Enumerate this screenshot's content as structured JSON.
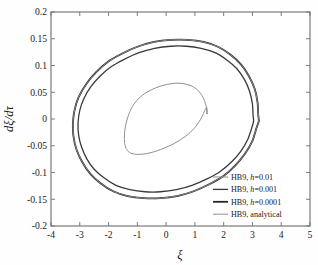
{
  "figure": {
    "background_color": "#fefefe",
    "plot_background_color": "#ffffff",
    "frame_color": "#6e6e6e"
  },
  "axes": {
    "x_label": "ξ",
    "y_label": "dξ/dτ",
    "x_ticks": [
      "-4",
      "-3",
      "-2",
      "-1",
      "0",
      "1",
      "2",
      "3",
      "4",
      "5"
    ],
    "y_ticks": [
      "0.2",
      "0.15",
      "0.1",
      "0.05",
      "0",
      "-0.05",
      "-0.1",
      "-0.15",
      "-0.2"
    ]
  },
  "legend": {
    "position": "lower-right",
    "border": false,
    "items": [
      {
        "label_prefix": "HB9, ",
        "label_italic": "h",
        "label_suffix": "=0.01",
        "full_label": "HB9, h=0.01",
        "color": "#8c8c8c",
        "width": 1.0
      },
      {
        "label_prefix": "HB9, ",
        "label_italic": "h",
        "label_suffix": "=0.001",
        "full_label": "HB9, h=0.001",
        "color": "#3a3a3a",
        "width": 1.3
      },
      {
        "label_prefix": "HB9, ",
        "label_italic": "h",
        "label_suffix": "=0.0001",
        "full_label": "HB9, h=0.0001",
        "color": "#262626",
        "width": 1.8
      },
      {
        "label_prefix": "HB9, ",
        "label_italic": "",
        "label_suffix": "analytical",
        "full_label": "HB9, analytical",
        "color": "#8c8c8c",
        "width": 1.0
      }
    ]
  },
  "chart_data": {
    "type": "line",
    "title": "",
    "xlabel": "ξ",
    "ylabel": "dξ/dτ",
    "xlim": [
      -4,
      5
    ],
    "ylim": [
      -0.2,
      0.2
    ],
    "xticks": [
      -4,
      -3,
      -2,
      -1,
      0,
      1,
      2,
      3,
      4,
      5
    ],
    "yticks": [
      -0.2,
      -0.15,
      -0.1,
      -0.05,
      0,
      0.05,
      0.1,
      0.15,
      0.2
    ],
    "grid": false,
    "legend_position": "lower right",
    "series": [
      {
        "name": "HB9, h=0.01",
        "color": "#8c8c8c",
        "linewidth": 1.0,
        "description": "small inner limit cycle, amplitude approx 1.45 in xi, 0.065 in dxi/dtau",
        "x": [
          1.42,
          1.4,
          1.33,
          1.22,
          1.08,
          0.88,
          0.62,
          0.34,
          0.06,
          -0.22,
          -0.5,
          -0.76,
          -0.98,
          -1.14,
          -1.26,
          -1.34,
          -1.4,
          -1.44,
          -1.45,
          -1.44,
          -1.4,
          -1.33,
          -1.22,
          -1.06,
          -0.86,
          -0.62,
          -0.34,
          -0.05,
          0.24,
          0.52,
          0.78,
          1.0,
          1.16,
          1.28,
          1.36,
          1.41,
          1.43,
          1.42
        ],
        "y": [
          0.01,
          0.022,
          0.035,
          0.046,
          0.055,
          0.062,
          0.066,
          0.067,
          0.065,
          0.061,
          0.055,
          0.047,
          0.037,
          0.026,
          0.014,
          0.002,
          -0.01,
          -0.024,
          -0.036,
          -0.046,
          -0.054,
          -0.06,
          -0.064,
          -0.066,
          -0.066,
          -0.064,
          -0.06,
          -0.054,
          -0.047,
          -0.038,
          -0.028,
          -0.016,
          -0.004,
          0.008,
          0.018,
          0.022,
          0.016,
          0.01
        ]
      },
      {
        "name": "HB9, h=0.001",
        "color": "#3a3a3a",
        "linewidth": 1.3,
        "description": "large limit cycle slightly inside the h=0.0001 curve, peak dxi/dtau approx 0.136",
        "x": [
          3.02,
          3.0,
          2.9,
          2.72,
          2.46,
          2.12,
          1.7,
          1.22,
          0.7,
          0.16,
          -0.4,
          -0.94,
          -1.44,
          -1.9,
          -2.3,
          -2.62,
          -2.86,
          -3.0,
          -3.06,
          -3.04,
          -2.94,
          -2.76,
          -2.5,
          -2.16,
          -1.74,
          -1.26,
          -0.74,
          -0.2,
          0.36,
          0.9,
          1.42,
          1.88,
          2.28,
          2.6,
          2.84,
          2.98,
          3.04,
          3.02
        ],
        "y": [
          0.008,
          0.028,
          0.052,
          0.074,
          0.094,
          0.11,
          0.124,
          0.132,
          0.136,
          0.136,
          0.132,
          0.124,
          0.112,
          0.098,
          0.08,
          0.06,
          0.038,
          0.016,
          -0.008,
          -0.03,
          -0.052,
          -0.074,
          -0.094,
          -0.11,
          -0.124,
          -0.132,
          -0.136,
          -0.136,
          -0.132,
          -0.124,
          -0.112,
          -0.098,
          -0.08,
          -0.06,
          -0.038,
          -0.016,
          -0.004,
          0.008
        ]
      },
      {
        "name": "HB9, h=0.0001",
        "color": "#262626",
        "linewidth": 1.8,
        "description": "outermost large limit cycle, peak dxi/dtau approx 0.148, xi extremes approx -3.22 to 3.24",
        "x": [
          3.2,
          3.18,
          3.08,
          2.88,
          2.6,
          2.24,
          1.8,
          1.3,
          0.74,
          0.16,
          -0.42,
          -1.0,
          -1.54,
          -2.02,
          -2.44,
          -2.78,
          -3.04,
          -3.18,
          -3.24,
          -3.22,
          -3.12,
          -2.92,
          -2.64,
          -2.28,
          -1.84,
          -1.34,
          -0.78,
          -0.2,
          0.38,
          0.96,
          1.5,
          1.98,
          2.4,
          2.74,
          3.0,
          3.14,
          3.22,
          3.2
        ],
        "y": [
          0.008,
          0.03,
          0.056,
          0.08,
          0.102,
          0.12,
          0.135,
          0.144,
          0.148,
          0.148,
          0.144,
          0.135,
          0.122,
          0.107,
          0.087,
          0.065,
          0.041,
          0.017,
          -0.008,
          -0.032,
          -0.056,
          -0.08,
          -0.102,
          -0.12,
          -0.135,
          -0.144,
          -0.148,
          -0.148,
          -0.144,
          -0.135,
          -0.122,
          -0.107,
          -0.087,
          -0.065,
          -0.041,
          -0.017,
          -0.004,
          0.008
        ]
      },
      {
        "name": "HB9, analytical",
        "color": "#8c8c8c",
        "linewidth": 1.0,
        "description": "analytical curve overlapping the h=0.0001 outer cycle",
        "x": [
          3.2,
          3.18,
          3.08,
          2.88,
          2.6,
          2.24,
          1.8,
          1.3,
          0.74,
          0.16,
          -0.42,
          -1.0,
          -1.54,
          -2.02,
          -2.44,
          -2.78,
          -3.04,
          -3.18,
          -3.24,
          -3.22,
          -3.12,
          -2.92,
          -2.64,
          -2.28,
          -1.84,
          -1.34,
          -0.78,
          -0.2,
          0.38,
          0.96,
          1.5,
          1.98,
          2.4,
          2.74,
          3.0,
          3.14,
          3.22,
          3.2
        ],
        "y": [
          0.008,
          0.03,
          0.056,
          0.08,
          0.102,
          0.12,
          0.135,
          0.144,
          0.148,
          0.148,
          0.144,
          0.135,
          0.122,
          0.107,
          0.087,
          0.065,
          0.041,
          0.017,
          -0.008,
          -0.032,
          -0.056,
          -0.08,
          -0.102,
          -0.12,
          -0.135,
          -0.144,
          -0.148,
          -0.148,
          -0.144,
          -0.135,
          -0.122,
          -0.107,
          -0.087,
          -0.065,
          -0.041,
          -0.017,
          -0.004,
          0.008
        ]
      }
    ]
  }
}
